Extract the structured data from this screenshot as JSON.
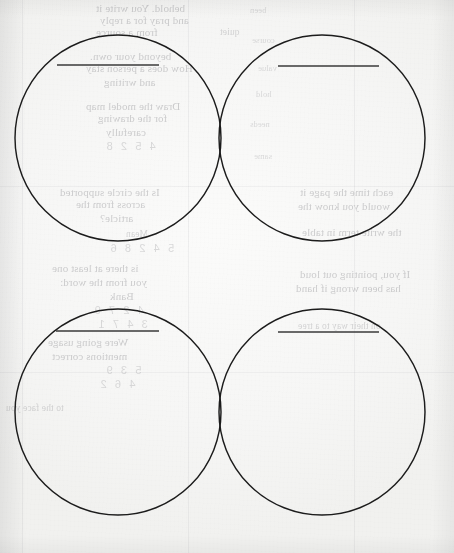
{
  "page": {
    "kind": "scanned-worksheet",
    "width": 454,
    "height": 553,
    "paper_color": "#f7f7f6",
    "ink_color": "#1c1c1c",
    "rule_color": "#3a3a3a",
    "ghost_text_color": "#8f8f93",
    "visible_text": "",
    "notes_label": "No legible printed text; all visible lettering is mirror-reversed bleed-through from the reverse side of the sheet."
  },
  "diagrams": [
    {
      "id": "venn-top",
      "name": "Venn diagram 1",
      "left_circle": {
        "cx": 118,
        "cy": 138,
        "r": 103,
        "label_value": "",
        "label_placeholder": ""
      },
      "right_circle": {
        "cx": 322,
        "cy": 138,
        "r": 103,
        "label_value": "",
        "label_placeholder": ""
      },
      "left_rule": {
        "x1": 57,
        "x2": 159,
        "y": 65
      },
      "right_rule": {
        "x1": 278,
        "x2": 379,
        "y": 66
      },
      "intersection_top_y": 28,
      "intersection_bottom_y": 248
    },
    {
      "id": "venn-bottom",
      "name": "Venn diagram 2",
      "left_circle": {
        "cx": 118,
        "cy": 412,
        "r": 103,
        "label_value": "",
        "label_placeholder": ""
      },
      "right_circle": {
        "cx": 322,
        "cy": 412,
        "r": 103,
        "label_value": "",
        "label_placeholder": ""
      },
      "left_rule": {
        "x1": 56,
        "x2": 159,
        "y": 331
      },
      "right_rule": {
        "x1": 278,
        "x2": 379,
        "y": 332
      },
      "intersection_top_y": 302,
      "intersection_bottom_y": 522
    }
  ],
  "ghost_text": {
    "description": "Mirror-reversed show-through lettering from the printed reverse of the page. Rendered as faint, unreadable smudged glyphs.",
    "lines": [
      {
        "x": 96,
        "y": 2,
        "size": "",
        "text": "behold. You write it"
      },
      {
        "x": 100,
        "y": 14,
        "size": "",
        "text": "and pray for a reply"
      },
      {
        "x": 96,
        "y": 26,
        "size": "",
        "text": "from a source"
      },
      {
        "x": 220,
        "y": 26,
        "size": "sm",
        "text": "quiet"
      },
      {
        "x": 90,
        "y": 50,
        "size": "",
        "text": "beyond your own."
      },
      {
        "x": 86,
        "y": 62,
        "size": "",
        "text": "How does a person stay"
      },
      {
        "x": 104,
        "y": 76,
        "size": "",
        "text": "and writing"
      },
      {
        "x": 86,
        "y": 100,
        "size": "",
        "text": "Draw the model map"
      },
      {
        "x": 98,
        "y": 112,
        "size": "",
        "text": "for the drawing"
      },
      {
        "x": 106,
        "y": 126,
        "size": "",
        "text": "carefully"
      },
      {
        "x": 104,
        "y": 140,
        "size": "num",
        "text": "4   5   2   8"
      },
      {
        "x": 60,
        "y": 186,
        "size": "",
        "text": "Is the circle supported"
      },
      {
        "x": 76,
        "y": 198,
        "size": "",
        "text": "across from the"
      },
      {
        "x": 100,
        "y": 212,
        "size": "",
        "text": "article?"
      },
      {
        "x": 126,
        "y": 228,
        "size": "sm",
        "text": "Mean"
      },
      {
        "x": 108,
        "y": 242,
        "size": "num",
        "text": "5   4   2   8   6"
      },
      {
        "x": 52,
        "y": 262,
        "size": "",
        "text": "is there at least one"
      },
      {
        "x": 60,
        "y": 276,
        "size": "",
        "text": "you from the word:"
      },
      {
        "x": 110,
        "y": 290,
        "size": "",
        "text": "Bank"
      },
      {
        "x": 92,
        "y": 304,
        "size": "num",
        "text": "4   2   7   9"
      },
      {
        "x": 96,
        "y": 318,
        "size": "num",
        "text": "3   4   7   1"
      },
      {
        "x": 48,
        "y": 336,
        "size": "",
        "text": "Were going usage"
      },
      {
        "x": 52,
        "y": 350,
        "size": "",
        "text": "mentions correct"
      },
      {
        "x": 104,
        "y": 364,
        "size": "num",
        "text": "5   3   9"
      },
      {
        "x": 98,
        "y": 378,
        "size": "num",
        "text": "4   6   2"
      },
      {
        "x": 6,
        "y": 402,
        "size": "sm",
        "text": "to the face you"
      },
      {
        "x": 250,
        "y": 4,
        "size": "xs",
        "text": "been"
      },
      {
        "x": 252,
        "y": 34,
        "size": "xs",
        "text": "course"
      },
      {
        "x": 258,
        "y": 62,
        "size": "xs",
        "text": "value"
      },
      {
        "x": 256,
        "y": 88,
        "size": "xs",
        "text": "hold"
      },
      {
        "x": 250,
        "y": 118,
        "size": "xs",
        "text": "needs"
      },
      {
        "x": 254,
        "y": 150,
        "size": "xs",
        "text": "same"
      },
      {
        "x": 300,
        "y": 186,
        "size": "",
        "text": "each time the page it"
      },
      {
        "x": 298,
        "y": 200,
        "size": "",
        "text": "would you know the"
      },
      {
        "x": 302,
        "y": 226,
        "size": "",
        "text": "the write term in table"
      },
      {
        "x": 300,
        "y": 268,
        "size": "",
        "text": "If you, pointing out loud"
      },
      {
        "x": 296,
        "y": 282,
        "size": "",
        "text": "has been wrong if hand"
      },
      {
        "x": 298,
        "y": 320,
        "size": "sm",
        "text": "on their way to a tree"
      }
    ]
  }
}
